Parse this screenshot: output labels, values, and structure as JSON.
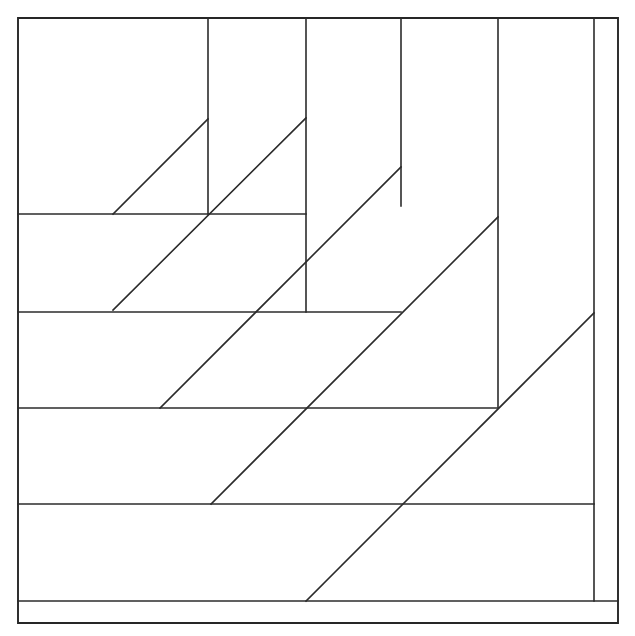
{
  "figure": {
    "title": "Nested right-triangle spiral line figure",
    "type": "line-drawing",
    "canvas": {
      "width": 635,
      "height": 636
    },
    "background_color": "#ffffff",
    "line_color": "#2b2b2b",
    "frame_color": "#262626",
    "line_width": 1.6,
    "frame_width": 1.9,
    "diagonal_angle_degrees": 45,
    "counts": {
      "frames": 1,
      "vertical_lines": 5,
      "horizontal_lines": 5,
      "diagonal_lines": 5,
      "total_segments": 16
    },
    "frame_rect": {
      "x1": 18,
      "y1": 18,
      "x2": 618,
      "y2": 623
    },
    "vertical_lines": [
      {
        "name": "vertical-1",
        "x": 208,
        "y1": 18,
        "y2": 214
      },
      {
        "name": "vertical-2",
        "x": 306,
        "y1": 18,
        "y2": 312
      },
      {
        "name": "vertical-3",
        "x": 401,
        "y1": 18,
        "y2": 206
      },
      {
        "name": "vertical-4",
        "x": 498,
        "y1": 18,
        "y2": 407
      },
      {
        "name": "vertical-5",
        "x": 594,
        "y1": 18,
        "y2": 601
      }
    ],
    "horizontal_lines": [
      {
        "name": "horizontal-1",
        "y": 214,
        "x1": 18,
        "x2": 306
      },
      {
        "name": "horizontal-2",
        "y": 312,
        "x1": 18,
        "x2": 401
      },
      {
        "name": "horizontal-3",
        "y": 408,
        "x1": 18,
        "x2": 498
      },
      {
        "name": "horizontal-4",
        "y": 504,
        "x1": 18,
        "x2": 594
      },
      {
        "name": "horizontal-5",
        "y": 601,
        "x1": 18,
        "x2": 618
      }
    ],
    "diagonal_lines": [
      {
        "name": "diagonal-1",
        "x1": 113,
        "y1": 214,
        "x2": 208,
        "y2": 119
      },
      {
        "name": "diagonal-2",
        "x1": 113,
        "y1": 310,
        "x2": 306,
        "y2": 118
      },
      {
        "name": "diagonal-3",
        "x1": 160,
        "y1": 408,
        "x2": 401,
        "y2": 167
      },
      {
        "name": "diagonal-4",
        "x1": 211,
        "y1": 504,
        "x2": 498,
        "y2": 217
      },
      {
        "name": "diagonal-5",
        "x1": 306,
        "y1": 601,
        "x2": 594,
        "y2": 313
      }
    ]
  }
}
